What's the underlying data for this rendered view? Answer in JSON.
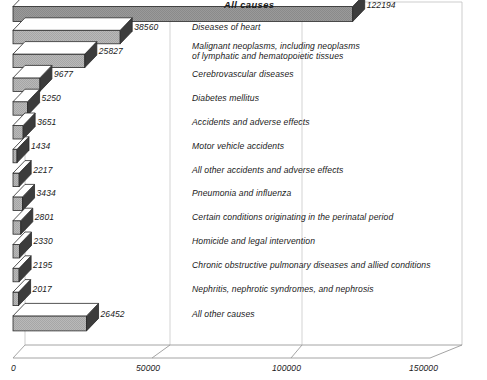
{
  "chart_data": {
    "type": "bar",
    "orientation": "horizontal",
    "title": "",
    "xlabel": "",
    "ylabel": "",
    "xlim": [
      0,
      150000
    ],
    "xticks": [
      0,
      50000,
      100000,
      150000
    ],
    "xticklabels": [
      "0",
      "50000",
      "100000",
      "150000"
    ],
    "grid": true,
    "legend": null,
    "categories": [
      "All causes",
      "Diseases of heart",
      "Malignant neoplasms, including neoplasms of lymphatic and hematopoietic tissues",
      "Cerebrovascular diseases",
      "Diabetes mellitus",
      "Accidents and adverse effects",
      "Motor vehicle accidents",
      "All other accidents and adverse effects",
      "Pneumonia and influenza",
      "Certain conditions originating in the perinatal period",
      "Homicide and legal intervention",
      "Chronic obstructive pulmonary diseases and allied conditions",
      "Nephritis, nephrotic syndromes, and nephrosis",
      "All other causes"
    ],
    "values": [
      122194,
      38560,
      25827,
      9677,
      5250,
      3651,
      1434,
      2217,
      3434,
      2801,
      2330,
      2195,
      2017,
      26452
    ]
  },
  "rows": [
    {
      "label_line1": "All causes",
      "label_line2": "",
      "value": 122194,
      "value_text": "122194",
      "emphasis": true
    },
    {
      "label_line1": "Diseases of heart",
      "label_line2": "",
      "value": 38560,
      "value_text": "38560",
      "emphasis": false
    },
    {
      "label_line1": "Malignant neoplasms, including neoplasms",
      "label_line2": "of lymphatic and hematopoietic tissues",
      "value": 25827,
      "value_text": "25827",
      "emphasis": false
    },
    {
      "label_line1": "Cerebrovascular diseases",
      "label_line2": "",
      "value": 9677,
      "value_text": "9677",
      "emphasis": false
    },
    {
      "label_line1": "Diabetes mellitus",
      "label_line2": "",
      "value": 5250,
      "value_text": "5250",
      "emphasis": false
    },
    {
      "label_line1": "Accidents and adverse effects",
      "label_line2": "",
      "value": 3651,
      "value_text": "3651",
      "emphasis": false
    },
    {
      "label_line1": "Motor vehicle accidents",
      "label_line2": "",
      "value": 1434,
      "value_text": "1434",
      "emphasis": false
    },
    {
      "label_line1": "All other accidents and adverse effects",
      "label_line2": "",
      "value": 2217,
      "value_text": "2217",
      "emphasis": false
    },
    {
      "label_line1": "Pneumonia and influenza",
      "label_line2": "",
      "value": 3434,
      "value_text": "3434",
      "emphasis": false
    },
    {
      "label_line1": "Certain conditions originating in the perinatal period",
      "label_line2": "",
      "value": 2801,
      "value_text": "2801",
      "emphasis": false
    },
    {
      "label_line1": "Homicide and legal intervention",
      "label_line2": "",
      "value": 2330,
      "value_text": "2330",
      "emphasis": false
    },
    {
      "label_line1": "Chronic obstructive pulmonary diseases and allied conditions",
      "label_line2": "",
      "value": 2195,
      "value_text": "2195",
      "emphasis": false
    },
    {
      "label_line1": "Nephritis, nephrotic syndromes, and nephrosis",
      "label_line2": "",
      "value": 2017,
      "value_text": "2017",
      "emphasis": false
    },
    {
      "label_line1": "All other causes",
      "label_line2": "",
      "value": 26452,
      "value_text": "26452",
      "emphasis": false
    }
  ],
  "axis": {
    "ticks": [
      {
        "text": "0",
        "value": 0
      },
      {
        "text": "50000",
        "value": 50000
      },
      {
        "text": "100000",
        "value": 100000
      },
      {
        "text": "150000",
        "value": 150000
      }
    ]
  },
  "colors": {
    "bar_front": "#b4b4b4",
    "bar_top": "#ffffff",
    "bar_end": "#3c3c3c",
    "outline": "#2a2a2a",
    "grid": "#c8c8c8",
    "text": "#1a1a1a",
    "background": "#ffffff"
  }
}
